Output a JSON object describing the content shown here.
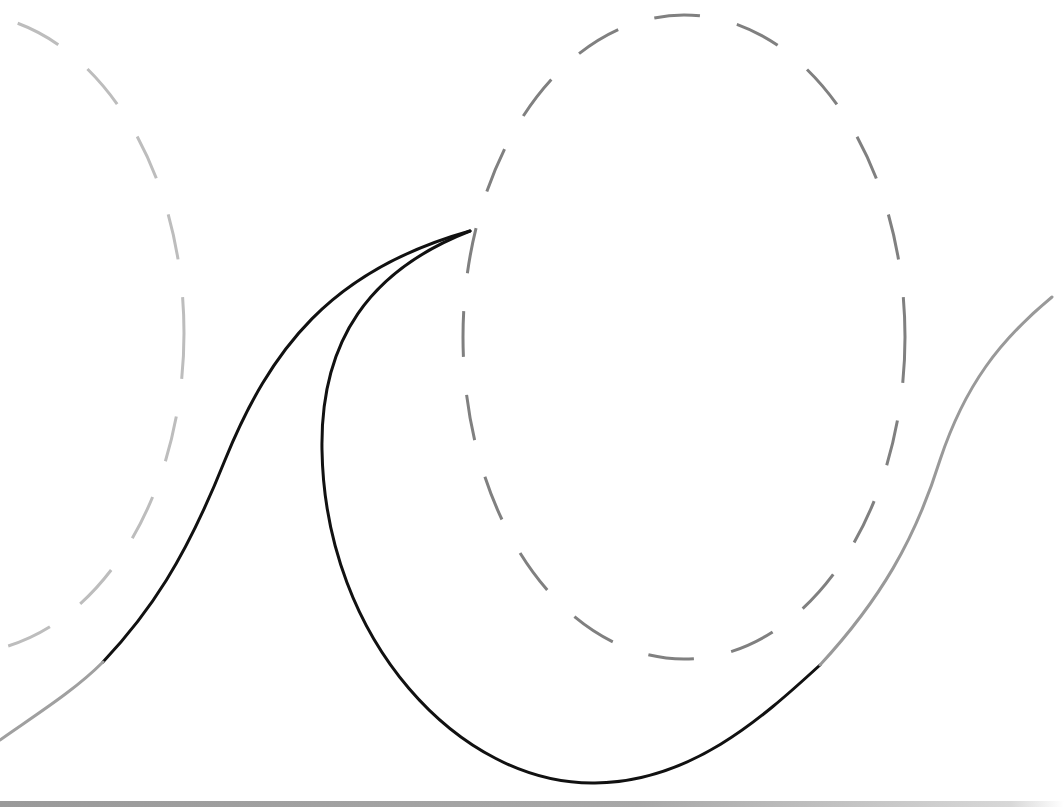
{
  "diagram": {
    "colors": {
      "background": "#ffffff",
      "curve_primary": "#111111",
      "curve_extension": "#999999",
      "ellipse_dark": "#808080",
      "ellipse_light": "#bdbdbd"
    },
    "ellipses": [
      {
        "name": "left-dashed-ellipse",
        "cx": -38,
        "cy": 333,
        "rx": 222,
        "ry": 320,
        "stroke": "#bdbdbd",
        "dash": "46 38",
        "width": 3
      },
      {
        "name": "right-dashed-ellipse",
        "cx": 684,
        "cy": 337,
        "rx": 221,
        "ry": 322,
        "stroke": "#808080",
        "dash": "46 38",
        "width": 3
      }
    ],
    "curves": [
      {
        "name": "left-black-curve",
        "d": "M 103 662 C 150 612, 185 560, 225 460 C 270 350, 330 270, 470 231",
        "stroke": "#111111",
        "width": 3
      },
      {
        "name": "right-black-curve",
        "d": "M 470 231 C 370 270, 320 340, 322 450 C 325 640, 460 785, 595 783 C 690 782, 760 720, 820 665",
        "stroke": "#111111",
        "width": 3
      },
      {
        "name": "left-grey-extension",
        "d": "M 0 740 C 40 712, 75 690, 103 662",
        "stroke": "#a0a0a0",
        "width": 3
      },
      {
        "name": "right-grey-extension",
        "d": "M 820 665 C 880 600, 915 540, 940 460 C 965 385, 1000 340, 1052 297",
        "stroke": "#999999",
        "width": 3
      }
    ],
    "junction_point": {
      "x": 470,
      "y": 231
    }
  }
}
